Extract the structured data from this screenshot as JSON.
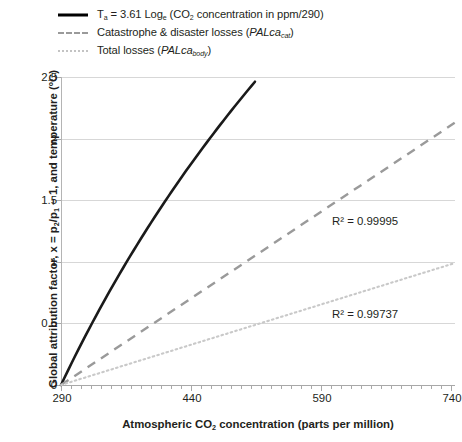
{
  "legend": {
    "items": [
      {
        "key": "solid-black-line",
        "name": "legend-item-temperature",
        "text_prefix": "T",
        "sub1": "a",
        "text_mid": " = 3.61 Log",
        "sub2": "e",
        "text_mid2": " (CO",
        "sub3": "2",
        "text_suffix": " concentration in ppm/290)"
      },
      {
        "key": "dashed-grey-line",
        "name": "legend-item-catastrophe-losses",
        "text_prefix": "Catastrophe & disaster losses (",
        "italic": "PALca",
        "sub1": "cat",
        "text_suffix": ")"
      },
      {
        "key": "dotted-grey-line",
        "name": "legend-item-total-losses",
        "text_prefix": "Total losses (",
        "italic": "PALca",
        "sub1": "body",
        "text_suffix": ")"
      }
    ]
  },
  "axes": {
    "y_title_part1": "Global attribution factor, ",
    "y_title_x": "x",
    "y_title_part2": " = p",
    "y_title_sub1": "2",
    "y_title_part3": "/p",
    "y_title_sub2": "1",
    "y_title_part4": " − 1, and temperature (ºC)",
    "x_title_part1": "Atmospheric CO",
    "x_title_sub": "2",
    "x_title_part2": " concentration (parts per million)",
    "y_ticks": [
      "0",
      "0.5",
      "1",
      "1.5",
      "2",
      "2.5"
    ],
    "x_ticks": [
      "290",
      "440",
      "590",
      "740"
    ]
  },
  "annotations": {
    "r2_dashed": "R²  =  0.99995",
    "r2_dotted": "R²  =  0.99737"
  },
  "colors": {
    "solid": "#1a1a1a",
    "dashed": "#9a9a9a",
    "dotted": "#c9c9c9",
    "grid": "#d7d7d7",
    "axis": "#a8a8a8",
    "text": "#231f20"
  },
  "chart_data": {
    "type": "line",
    "title": "",
    "xlabel": "Atmospheric CO2 concentration (parts per million)",
    "ylabel": "Global attribution factor, x = p2/p1 − 1, and temperature (ºC)",
    "xlim": [
      290,
      745
    ],
    "ylim": [
      0,
      2.5
    ],
    "grid": true,
    "legend_position": "top-left-outside",
    "series": [
      {
        "name": "Ta = 3.61 Loge (CO2 concentration in ppm/290)",
        "style": "solid",
        "color": "#1a1a1a",
        "x": [
          290,
          305,
          320,
          340,
          360,
          380,
          400,
          420,
          440,
          460,
          480,
          500,
          515
        ],
        "y": [
          0.0,
          0.182,
          0.355,
          0.573,
          0.779,
          0.974,
          1.159,
          1.335,
          1.503,
          1.664,
          1.818,
          1.966,
          2.073
        ],
        "y_rendered_end": 2.47,
        "note": "Logarithmic curve drawn from (290, 0) rising to approximately 2.47 at x ≈ 515 ppm"
      },
      {
        "name": "Catastrophe & disaster losses (PALcacat)",
        "style": "dashed",
        "color": "#9a9a9a",
        "x": [
          290,
          745
        ],
        "y": [
          0.0,
          2.13
        ],
        "r2": 0.99995
      },
      {
        "name": "Total losses (PALcabody)",
        "style": "dotted",
        "color": "#c9c9c9",
        "x": [
          290,
          745
        ],
        "y": [
          0.0,
          0.99
        ],
        "r2": 0.99737
      }
    ],
    "annotations": [
      {
        "text": "R² = 0.99995",
        "x": 600,
        "y": 1.4
      },
      {
        "text": "R² = 0.99737",
        "x": 600,
        "y": 0.48
      }
    ]
  }
}
